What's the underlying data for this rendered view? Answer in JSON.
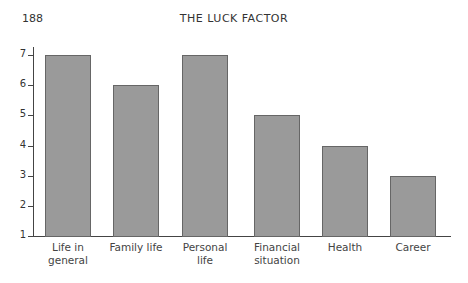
{
  "header": {
    "page_number": "188",
    "running_head": "THE LUCK FACTOR"
  },
  "chart_data": {
    "type": "bar",
    "title": "",
    "xlabel": "",
    "ylabel": "",
    "categories": [
      "Life in general",
      "Family life",
      "Personal life",
      "Financial situation",
      "Health",
      "Career"
    ],
    "category_lines": [
      [
        "Life in",
        "general"
      ],
      [
        "Family life",
        ""
      ],
      [
        "Personal",
        "life"
      ],
      [
        "Financial",
        "situation"
      ],
      [
        "Health",
        ""
      ],
      [
        "Career",
        ""
      ]
    ],
    "values": [
      7,
      6,
      7,
      5,
      4,
      3
    ],
    "ylim": [
      1,
      7
    ],
    "yticks": [
      "1",
      "2",
      "3",
      "4",
      "5",
      "6",
      "7"
    ],
    "grid": false,
    "bar_color": "#9a9a9a"
  }
}
